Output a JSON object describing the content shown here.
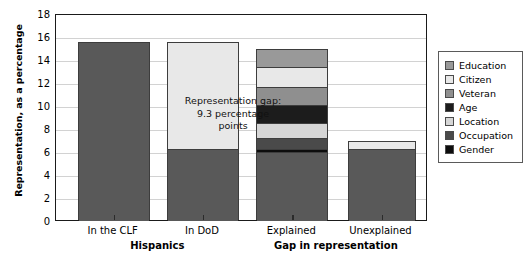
{
  "chart_data": {
    "type": "bar",
    "subtype": "stacked-bar",
    "title": "",
    "xlabel": "",
    "ylabel": "Representation, as a percentage",
    "ylim": [
      0,
      18
    ],
    "yticks": [
      0,
      2,
      4,
      6,
      8,
      10,
      12,
      14,
      16,
      18
    ],
    "grid": true,
    "legend_position": "right",
    "categories": [
      "In the CLF",
      "In DoD",
      "Explained",
      "Unexplained"
    ],
    "group_labels": [
      {
        "label": "Hispanics",
        "categories": [
          "In the CLF",
          "In DoD"
        ]
      },
      {
        "label": "Gap in representation",
        "categories": [
          "Explained",
          "Unexplained"
        ]
      }
    ],
    "series": [
      {
        "name": "Gender",
        "color": "#0d0d0d",
        "values": [
          0,
          0,
          0.2,
          0
        ]
      },
      {
        "name": "Occupation",
        "color": "#4a4a4a",
        "values": [
          0,
          0,
          0.9,
          0
        ]
      },
      {
        "name": "Location",
        "color": "#d6d6d6",
        "values": [
          0,
          0,
          1.3,
          0
        ]
      },
      {
        "name": "Age",
        "color": "#1c1c1c",
        "values": [
          0,
          0,
          1.6,
          0
        ]
      },
      {
        "name": "Veteran",
        "color": "#8f8f8f",
        "values": [
          0,
          0,
          1.6,
          0
        ]
      },
      {
        "name": "Citizen",
        "color": "#e8e8e8",
        "values": [
          0,
          0,
          2.1,
          0.7
        ]
      },
      {
        "name": "Education",
        "color": "#999999",
        "values": [
          0,
          0,
          7.2,
          0
        ]
      },
      {
        "name": "Base",
        "color": "#595959",
        "values": [
          15.5,
          6.2,
          0,
          6.2
        ]
      },
      {
        "name": "Gap",
        "color": "#e8e8e8",
        "values": [
          0,
          9.3,
          0,
          0
        ]
      }
    ],
    "bars": [
      {
        "category": "In the CLF",
        "total": 15.5,
        "segments": [
          {
            "name": "Representation",
            "value": 15.5,
            "color": "#595959"
          }
        ]
      },
      {
        "category": "In DoD",
        "total": 15.5,
        "segments": [
          {
            "name": "Representation gap",
            "value": 9.3,
            "color": "#e8e8e8"
          },
          {
            "name": "Representation",
            "value": 6.2,
            "color": "#595959"
          }
        ]
      },
      {
        "category": "Explained",
        "total": 14.9,
        "segments": [
          {
            "name": "Education",
            "value": 1.6,
            "color": "#999999"
          },
          {
            "name": "Citizen",
            "value": 1.7,
            "color": "#e8e8e8"
          },
          {
            "name": "Veteran",
            "value": 1.6,
            "color": "#8f8f8f"
          },
          {
            "name": "Age",
            "value": 1.6,
            "color": "#1c1c1c"
          },
          {
            "name": "Location",
            "value": 1.3,
            "color": "#d6d6d6"
          },
          {
            "name": "Occupation",
            "value": 0.9,
            "color": "#4a4a4a"
          },
          {
            "name": "Gender",
            "value": 0.3,
            "color": "#0d0d0d"
          },
          {
            "name": "Remainder",
            "value": 5.9,
            "color": "#595959"
          }
        ]
      },
      {
        "category": "Unexplained",
        "total": 6.9,
        "segments": [
          {
            "name": "Citizen",
            "value": 0.7,
            "color": "#e8e8e8"
          },
          {
            "name": "Remainder",
            "value": 6.2,
            "color": "#595959"
          }
        ]
      }
    ],
    "annotations": [
      {
        "name": "representation-gap-annotation",
        "line1": "Representation gap:",
        "line2": "9.3 percentage",
        "line3": "points"
      }
    ],
    "legend": [
      {
        "label": "Education",
        "color": "#999999"
      },
      {
        "label": "Citizen",
        "color": "#e8e8e8"
      },
      {
        "label": "Veteran",
        "color": "#8f8f8f"
      },
      {
        "label": "Age",
        "color": "#1c1c1c"
      },
      {
        "label": "Location",
        "color": "#d6d6d6"
      },
      {
        "label": "Occupation",
        "color": "#4a4a4a"
      },
      {
        "label": "Gender",
        "color": "#0d0d0d"
      }
    ]
  }
}
